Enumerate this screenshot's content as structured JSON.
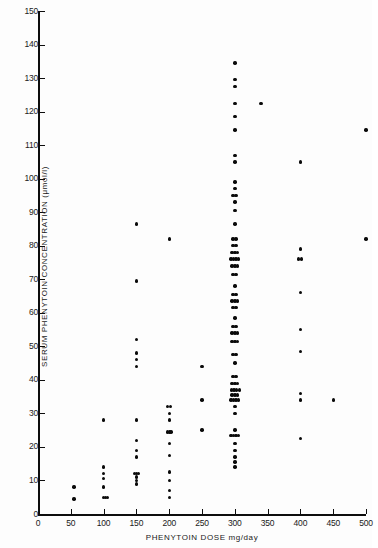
{
  "chart_data": {
    "type": "scatter",
    "title": "",
    "xlabel": "PHENYTOIN DOSE mg/day",
    "ylabel": "SERUM PHENYTOIN CONCENTRATION (μmol/l)",
    "xlim": [
      0,
      500
    ],
    "ylim": [
      0,
      150
    ],
    "grid": false,
    "legend": null,
    "xticks": [
      0,
      50,
      100,
      150,
      200,
      250,
      300,
      350,
      400,
      450,
      500
    ],
    "xticklabels": [
      "0",
      "50",
      "100",
      "150",
      "200",
      "250",
      "300",
      "350",
      "400",
      "450",
      "500"
    ],
    "yticks": [
      0,
      10,
      20,
      30,
      40,
      50,
      60,
      70,
      80,
      90,
      100,
      110,
      120,
      130,
      140,
      150
    ],
    "yticklabels": [
      "0",
      "10",
      "20",
      "30",
      "40",
      "50",
      "60",
      "70",
      "80",
      "90",
      "100",
      "110",
      "120",
      "130",
      "140",
      "150"
    ],
    "marker": "filled-circle",
    "marker_color": "#0a0a0a",
    "points": [
      {
        "x": 55,
        "y": 8
      },
      {
        "x": 55,
        "y": 4.5
      },
      {
        "x": 100,
        "y": 28
      },
      {
        "x": 100,
        "y": 14
      },
      {
        "x": 100,
        "y": 12
      },
      {
        "x": 100,
        "y": 10.5
      },
      {
        "x": 100,
        "y": 8
      },
      {
        "x": 100,
        "y": 5
      },
      {
        "x": 103,
        "y": 5
      },
      {
        "x": 106,
        "y": 5
      },
      {
        "x": 150,
        "y": 86.5
      },
      {
        "x": 150,
        "y": 69.5
      },
      {
        "x": 150,
        "y": 52
      },
      {
        "x": 150,
        "y": 48
      },
      {
        "x": 150,
        "y": 46
      },
      {
        "x": 150,
        "y": 44
      },
      {
        "x": 150,
        "y": 28
      },
      {
        "x": 150,
        "y": 22
      },
      {
        "x": 150,
        "y": 19
      },
      {
        "x": 150,
        "y": 17
      },
      {
        "x": 147,
        "y": 12
      },
      {
        "x": 150,
        "y": 12
      },
      {
        "x": 153,
        "y": 12
      },
      {
        "x": 150,
        "y": 11
      },
      {
        "x": 150,
        "y": 10
      },
      {
        "x": 150,
        "y": 9
      },
      {
        "x": 200,
        "y": 82
      },
      {
        "x": 197,
        "y": 32
      },
      {
        "x": 202,
        "y": 32
      },
      {
        "x": 200,
        "y": 30
      },
      {
        "x": 200,
        "y": 28
      },
      {
        "x": 197,
        "y": 24.5
      },
      {
        "x": 200,
        "y": 24.5
      },
      {
        "x": 203,
        "y": 24.5
      },
      {
        "x": 200,
        "y": 21
      },
      {
        "x": 200,
        "y": 17.5
      },
      {
        "x": 200,
        "y": 12.5
      },
      {
        "x": 200,
        "y": 10
      },
      {
        "x": 200,
        "y": 7
      },
      {
        "x": 200,
        "y": 5
      },
      {
        "x": 250,
        "y": 44
      },
      {
        "x": 250,
        "y": 34
      },
      {
        "x": 250,
        "y": 25
      },
      {
        "x": 300,
        "y": 134.5
      },
      {
        "x": 300,
        "y": 129.5
      },
      {
        "x": 300,
        "y": 127.5
      },
      {
        "x": 300,
        "y": 122.5
      },
      {
        "x": 300,
        "y": 118.5
      },
      {
        "x": 300,
        "y": 114.5
      },
      {
        "x": 300,
        "y": 107
      },
      {
        "x": 300,
        "y": 105
      },
      {
        "x": 300,
        "y": 99
      },
      {
        "x": 300,
        "y": 97
      },
      {
        "x": 297,
        "y": 95
      },
      {
        "x": 302,
        "y": 95
      },
      {
        "x": 300,
        "y": 93
      },
      {
        "x": 300,
        "y": 90.5
      },
      {
        "x": 300,
        "y": 86.5
      },
      {
        "x": 297,
        "y": 82
      },
      {
        "x": 302,
        "y": 82
      },
      {
        "x": 297,
        "y": 80
      },
      {
        "x": 302,
        "y": 80
      },
      {
        "x": 296,
        "y": 78
      },
      {
        "x": 300,
        "y": 78
      },
      {
        "x": 304,
        "y": 78
      },
      {
        "x": 294,
        "y": 76
      },
      {
        "x": 298,
        "y": 76
      },
      {
        "x": 302,
        "y": 76
      },
      {
        "x": 306,
        "y": 76
      },
      {
        "x": 296,
        "y": 74
      },
      {
        "x": 300,
        "y": 74
      },
      {
        "x": 304,
        "y": 74
      },
      {
        "x": 297,
        "y": 71.5
      },
      {
        "x": 302,
        "y": 71.5
      },
      {
        "x": 300,
        "y": 68
      },
      {
        "x": 297,
        "y": 65.5
      },
      {
        "x": 302,
        "y": 65.5
      },
      {
        "x": 296,
        "y": 63.5
      },
      {
        "x": 300,
        "y": 63.5
      },
      {
        "x": 304,
        "y": 63.5
      },
      {
        "x": 297,
        "y": 61.5
      },
      {
        "x": 302,
        "y": 61.5
      },
      {
        "x": 300,
        "y": 58.5
      },
      {
        "x": 297,
        "y": 56
      },
      {
        "x": 302,
        "y": 56
      },
      {
        "x": 296,
        "y": 54
      },
      {
        "x": 300,
        "y": 54
      },
      {
        "x": 304,
        "y": 54
      },
      {
        "x": 296,
        "y": 51.5
      },
      {
        "x": 300,
        "y": 51.5
      },
      {
        "x": 304,
        "y": 51.5
      },
      {
        "x": 297,
        "y": 47.5
      },
      {
        "x": 302,
        "y": 47.5
      },
      {
        "x": 300,
        "y": 45
      },
      {
        "x": 297,
        "y": 41
      },
      {
        "x": 302,
        "y": 41
      },
      {
        "x": 296,
        "y": 39
      },
      {
        "x": 300,
        "y": 39
      },
      {
        "x": 304,
        "y": 39
      },
      {
        "x": 295,
        "y": 37
      },
      {
        "x": 299,
        "y": 37
      },
      {
        "x": 303,
        "y": 37
      },
      {
        "x": 307,
        "y": 37
      },
      {
        "x": 296,
        "y": 35.5
      },
      {
        "x": 300,
        "y": 35.5
      },
      {
        "x": 304,
        "y": 35.5
      },
      {
        "x": 294,
        "y": 34
      },
      {
        "x": 298,
        "y": 34
      },
      {
        "x": 302,
        "y": 34
      },
      {
        "x": 306,
        "y": 34
      },
      {
        "x": 300,
        "y": 32
      },
      {
        "x": 300,
        "y": 30
      },
      {
        "x": 294,
        "y": 23.5
      },
      {
        "x": 298,
        "y": 23.5
      },
      {
        "x": 302,
        "y": 23.5
      },
      {
        "x": 306,
        "y": 23.5
      },
      {
        "x": 300,
        "y": 25
      },
      {
        "x": 300,
        "y": 21
      },
      {
        "x": 300,
        "y": 19
      },
      {
        "x": 300,
        "y": 17
      },
      {
        "x": 300,
        "y": 15.5
      },
      {
        "x": 300,
        "y": 14
      },
      {
        "x": 340,
        "y": 122.5
      },
      {
        "x": 400,
        "y": 105
      },
      {
        "x": 400,
        "y": 79
      },
      {
        "x": 397,
        "y": 76
      },
      {
        "x": 402,
        "y": 76
      },
      {
        "x": 400,
        "y": 66
      },
      {
        "x": 400,
        "y": 55
      },
      {
        "x": 400,
        "y": 48.5
      },
      {
        "x": 400,
        "y": 36
      },
      {
        "x": 400,
        "y": 34
      },
      {
        "x": 400,
        "y": 22.5
      },
      {
        "x": 450,
        "y": 34
      },
      {
        "x": 500,
        "y": 114.5
      },
      {
        "x": 500,
        "y": 82
      }
    ]
  }
}
